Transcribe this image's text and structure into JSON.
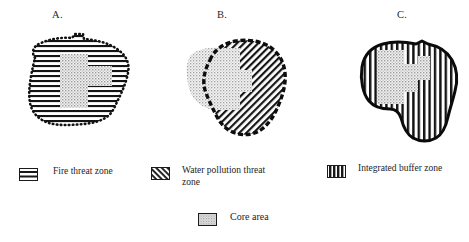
{
  "figure": {
    "type": "map-diagram",
    "background_color": "#ffffff",
    "ink_color": "#1a1a1a",
    "core_fill_color": "#c9c9c9"
  },
  "panels": [
    {
      "id": "a",
      "label": "A.",
      "pattern": "horizontal-lines",
      "outline_style": "dotted",
      "theme": "fire-threat-zone",
      "has_core_area": true
    },
    {
      "id": "b",
      "label": "B.",
      "pattern": "diagonal-lines",
      "outline_style": "dashed-thick",
      "theme": "water-pollution-threat-zone",
      "has_core_area": true
    },
    {
      "id": "c",
      "label": "C.",
      "pattern": "vertical-lines",
      "outline_style": "solid-thick",
      "theme": "integrated-buffer-zone",
      "has_core_area": true
    }
  ],
  "legend": {
    "items": [
      {
        "key": "fire",
        "label": "Fire threat zone",
        "swatch": "horizontal-lines-swatch"
      },
      {
        "key": "water",
        "label": "Water pollution threat zone",
        "swatch": "diagonal-lines-swatch"
      },
      {
        "key": "buffer",
        "label": "Integrated buffer zone",
        "swatch": "vertical-lines-swatch"
      },
      {
        "key": "core",
        "label": "Core area",
        "swatch": "stipple-swatch"
      }
    ]
  }
}
